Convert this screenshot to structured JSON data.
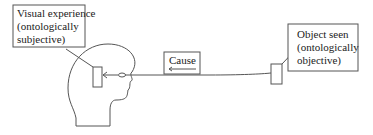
{
  "diagram": {
    "type": "perception-causal-diagram",
    "labels": {
      "visual_experience": [
        "Visual experience",
        "(ontologically",
        "subjective)"
      ],
      "object_seen": [
        "Object seen",
        "(ontologically",
        "objective)"
      ],
      "cause": "Cause"
    },
    "nodes": [
      {
        "id": "head",
        "kind": "head-silhouette"
      },
      {
        "id": "inner-rectangle",
        "kind": "visual-experience-marker"
      },
      {
        "id": "eye",
        "kind": "eye"
      },
      {
        "id": "object",
        "kind": "object-rectangle"
      }
    ],
    "edges": [
      {
        "from": "object",
        "to": "inner-rectangle",
        "label": "Cause",
        "direction": "right-to-left"
      }
    ],
    "colors": {
      "stroke": "#555555",
      "text": "#222222",
      "background": "#ffffff"
    }
  }
}
